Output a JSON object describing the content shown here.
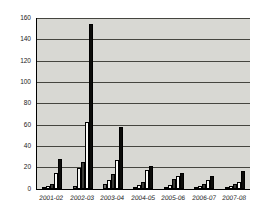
{
  "chart_data": {
    "type": "bar",
    "title": "",
    "xlabel": "",
    "ylabel": "",
    "categories": [
      "2001-02",
      "2002-03",
      "2003-04",
      "2004-05",
      "2005-06",
      "2006-07",
      "2007-08"
    ],
    "series": [
      {
        "name": "series-1",
        "color": "#6b6b66",
        "values": [
          2,
          3,
          5,
          2,
          2,
          2,
          2
        ]
      },
      {
        "name": "series-2",
        "color": "#f6f6f2",
        "values": [
          3,
          20,
          8,
          4,
          4,
          3,
          3
        ]
      },
      {
        "name": "series-3",
        "color": "#3a3a36",
        "values": [
          5,
          25,
          14,
          7,
          9,
          5,
          5
        ]
      },
      {
        "name": "series-4",
        "color": "#fbfbf8",
        "values": [
          15,
          63,
          27,
          18,
          12,
          8,
          7
        ]
      },
      {
        "name": "series-5",
        "color": "#0c0c0a",
        "values": [
          28,
          155,
          58,
          22,
          15,
          12,
          17
        ]
      }
    ],
    "ylim": [
      0,
      160
    ],
    "yticks": [
      0,
      20,
      40,
      60,
      80,
      100,
      120,
      140,
      160
    ],
    "grid": "horizontal-only",
    "gridline_color": "#45453f",
    "plot_background_color": "#d8d8d3",
    "page_background_color": "#ffffff",
    "axis_color": "#000000",
    "legend": "none"
  }
}
